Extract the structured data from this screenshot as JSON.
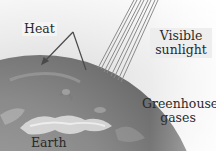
{
  "figure": {
    "labels": {
      "heat": "Heat",
      "sunlight_line1": "Visible",
      "sunlight_line2": "sunlight",
      "greenhouse_line1": "Greenhouse",
      "greenhouse_line2": "gases",
      "earth": "Earth"
    },
    "colors": {
      "earth_dark": "#6a6a6a",
      "earth_mid": "#8c8c8c",
      "earth_light": "#b5b5b5",
      "cloud": "#e0e0e0",
      "ray": "#8a8a8a",
      "arrow": "#4a4a4a",
      "text": "#2a2a2a"
    }
  }
}
